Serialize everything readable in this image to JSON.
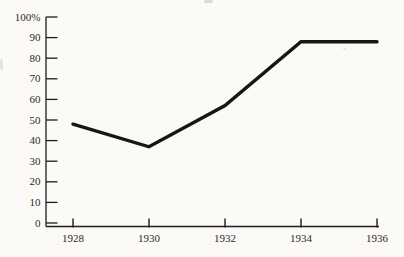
{
  "chart_data": {
    "type": "line",
    "title": "",
    "xlabel": "",
    "ylabel": "",
    "categories": [
      "1928",
      "1930",
      "1932",
      "1934",
      "1936"
    ],
    "x": [
      1928,
      1930,
      1932,
      1934,
      1936
    ],
    "series": [
      {
        "name": "percentage",
        "values": [
          48,
          37,
          57,
          88,
          88
        ]
      }
    ],
    "ylim": [
      0,
      100
    ],
    "xlim": [
      1928,
      1936
    ],
    "y_ticks": [
      0,
      10,
      20,
      30,
      40,
      50,
      60,
      70,
      80,
      90,
      100
    ],
    "y_tick_labels": [
      "0",
      "10",
      "20",
      "30",
      "40",
      "50",
      "60",
      "70",
      "80",
      "90",
      "100%"
    ],
    "grid": false,
    "legend_position": "none",
    "colors": {
      "line": "#161616",
      "axis": "#1c1c1c",
      "tick": "#1c1c1c",
      "label": "#2b2a28",
      "background": "#fbfaf7"
    }
  }
}
